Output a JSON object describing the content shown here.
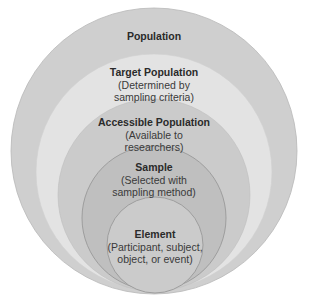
{
  "diagram": {
    "type": "nested-circles",
    "levels": [
      {
        "id": "population",
        "title": "Population",
        "subtitle": "",
        "color": "#cfcfcf",
        "cx": 154,
        "cy": 151,
        "r": 143
      },
      {
        "id": "target",
        "title": "Target Population",
        "subtitle_lines": [
          "(Determined by",
          "sampling criteria)"
        ],
        "color": "#e3e3e3",
        "cx": 154,
        "cy": 172,
        "r": 118
      },
      {
        "id": "accessible",
        "title": "Accessible Population",
        "subtitle_lines": [
          "(Available to",
          "researchers)"
        ],
        "color": "#cbcbcb",
        "cx": 154,
        "cy": 195,
        "r": 96
      },
      {
        "id": "sample",
        "title": "Sample",
        "subtitle_lines": [
          "(Selected with",
          "sampling method)"
        ],
        "color": "#bfbfbf",
        "cx": 154,
        "cy": 218,
        "r": 72
      },
      {
        "id": "element",
        "title": "Element",
        "subtitle_lines": [
          "(Participant, subject,",
          "object, or event)"
        ],
        "color": "#cbcbcb",
        "cx": 155,
        "cy": 245,
        "r": 48
      }
    ]
  }
}
